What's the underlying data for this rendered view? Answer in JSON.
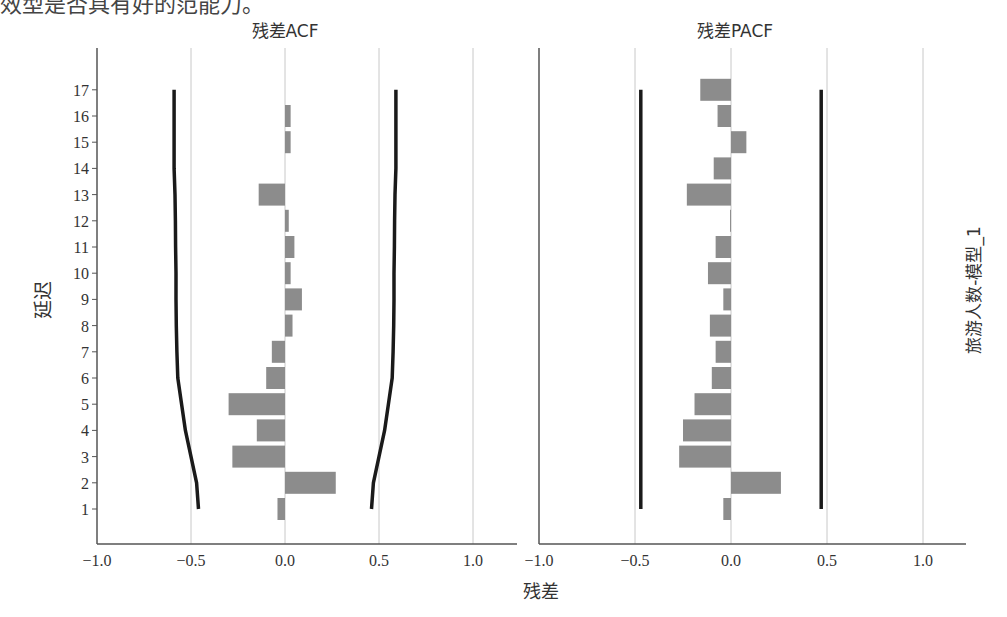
{
  "top_text": "效型是否具有好的范能力。",
  "titles": {
    "left": "残差ACF",
    "right": "残差PACF"
  },
  "labels": {
    "y_axis": "延迟",
    "x_axis": "残差",
    "right_side": "旅游人数-模型_1"
  },
  "colors": {
    "bar": "#8c8c8c",
    "bound": "#1a1a1a",
    "grid": "#c8c8c8",
    "axis": "#555555"
  },
  "chart_data": [
    {
      "type": "bar",
      "orientation": "horizontal",
      "title": "残差ACF",
      "xlabel": "残差",
      "ylabel": "延迟",
      "xlim": [
        -1.0,
        1.2
      ],
      "xticks": [
        -1.0,
        -0.5,
        0.0,
        0.5,
        1.0
      ],
      "xtick_labels": [
        "−1.0",
        "−0.5",
        "0.0",
        "0.5",
        "1.0"
      ],
      "categories": [
        1,
        2,
        3,
        4,
        5,
        6,
        7,
        8,
        9,
        10,
        11,
        12,
        13,
        14,
        15,
        16,
        17
      ],
      "values": [
        -0.04,
        0.27,
        -0.28,
        -0.15,
        -0.3,
        -0.1,
        -0.07,
        0.04,
        0.09,
        0.03,
        0.05,
        0.02,
        -0.14,
        0.0,
        0.03,
        0.03,
        0.0
      ],
      "upper_bound": [
        0.46,
        0.47,
        0.5,
        0.53,
        0.55,
        0.57,
        0.575,
        0.578,
        0.58,
        0.58,
        0.582,
        0.583,
        0.585,
        0.59,
        0.59,
        0.59,
        0.59
      ],
      "lower_bound": [
        -0.46,
        -0.47,
        -0.5,
        -0.53,
        -0.55,
        -0.57,
        -0.575,
        -0.578,
        -0.58,
        -0.58,
        -0.582,
        -0.583,
        -0.585,
        -0.59,
        -0.59,
        -0.59,
        -0.59
      ],
      "grid": true
    },
    {
      "type": "bar",
      "orientation": "horizontal",
      "title": "残差PACF",
      "xlabel": "残差",
      "ylabel": "延迟",
      "xlim": [
        -1.0,
        1.2
      ],
      "xticks": [
        -1.0,
        -0.5,
        0.0,
        0.5,
        1.0
      ],
      "xtick_labels": [
        "−1.0",
        "−0.5",
        "0.0",
        "0.5",
        "1.0"
      ],
      "categories": [
        1,
        2,
        3,
        4,
        5,
        6,
        7,
        8,
        9,
        10,
        11,
        12,
        13,
        14,
        15,
        16,
        17
      ],
      "values": [
        -0.04,
        0.26,
        -0.27,
        -0.25,
        -0.19,
        -0.1,
        -0.08,
        -0.11,
        -0.04,
        -0.12,
        -0.08,
        -0.005,
        -0.23,
        -0.09,
        0.08,
        -0.07,
        -0.16
      ],
      "upper_bound": [
        0.47,
        0.47,
        0.47,
        0.47,
        0.47,
        0.47,
        0.47,
        0.47,
        0.47,
        0.47,
        0.47,
        0.47,
        0.47,
        0.47,
        0.47,
        0.47,
        0.47
      ],
      "lower_bound": [
        -0.47,
        -0.47,
        -0.47,
        -0.47,
        -0.47,
        -0.47,
        -0.47,
        -0.47,
        -0.47,
        -0.47,
        -0.47,
        -0.47,
        -0.47,
        -0.47,
        -0.47,
        -0.47,
        -0.47
      ],
      "grid": true,
      "side_label": "旅游人数-模型_1"
    }
  ]
}
